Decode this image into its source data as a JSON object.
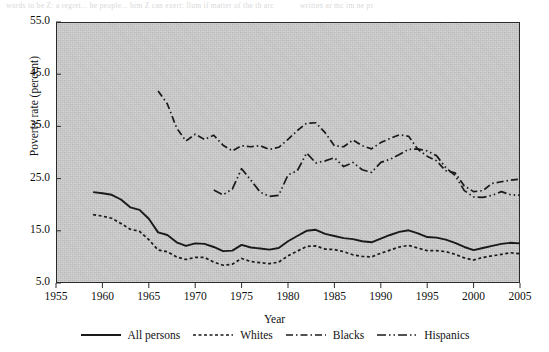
{
  "figure": {
    "ghost_text_top_left": "words to be Z: a regret... be people... him Z can exert: llum  if  matter of  the  th  arc",
    "ghost_text_top_right": "written   ar  mc  im  ne  pr"
  },
  "axes": {
    "y_label": "Poverty rate (percent)",
    "x_label": "Year",
    "y_ticks": [
      "5.0",
      "15.0",
      "25.0",
      "35.0",
      "45.0",
      "55.0"
    ],
    "y_tick_values": [
      5,
      15,
      25,
      35,
      45,
      55
    ],
    "x_ticks": [
      "1955",
      "1960",
      "1965",
      "1970",
      "1975",
      "1980",
      "1985",
      "1990",
      "1995",
      "2000",
      "2005"
    ],
    "x_tick_values": [
      1955,
      1960,
      1965,
      1970,
      1975,
      1980,
      1985,
      1990,
      1995,
      2000,
      2005
    ]
  },
  "legend": {
    "items": [
      {
        "label": "All persons",
        "style": "solid",
        "dash": "none",
        "icon": "solid-line-icon"
      },
      {
        "label": "Whites",
        "style": "dotted",
        "dash": "3,2.5",
        "icon": "dotted-line-icon"
      },
      {
        "label": "Blacks",
        "style": "dash-dot",
        "dash": "7,3,1.5,3",
        "icon": "dash-dot-line-icon"
      },
      {
        "label": "Hispanics",
        "style": "dash-dot-dot",
        "dash": "9,3,1.5,3,1.5,3",
        "icon": "dash-dot-dot-line-icon"
      }
    ]
  },
  "colors": {
    "plot_background": "#c9c9c9",
    "line": "#1a1a1a",
    "axis": "#2a2a2a",
    "text": "#111111"
  },
  "chart_data": {
    "type": "line",
    "title": "",
    "xlabel": "Year",
    "ylabel": "Poverty rate (percent)",
    "xlim": [
      1955,
      2005
    ],
    "ylim": [
      5.0,
      55.0
    ],
    "grid": false,
    "legend_position": "below",
    "series": [
      {
        "name": "All persons",
        "style": "solid",
        "x": [
          1959,
          1960,
          1961,
          1962,
          1963,
          1964,
          1965,
          1966,
          1967,
          1968,
          1969,
          1970,
          1971,
          1972,
          1973,
          1974,
          1975,
          1976,
          1977,
          1978,
          1979,
          1980,
          1981,
          1982,
          1983,
          1984,
          1985,
          1986,
          1987,
          1988,
          1989,
          1990,
          1991,
          1992,
          1993,
          1994,
          1995,
          1996,
          1997,
          1998,
          1999,
          2000,
          2001,
          2002,
          2003,
          2004,
          2005
        ],
        "values": [
          22.4,
          22.2,
          21.9,
          21.0,
          19.5,
          19.0,
          17.3,
          14.7,
          14.2,
          12.8,
          12.1,
          12.6,
          12.5,
          11.9,
          11.1,
          11.2,
          12.3,
          11.8,
          11.6,
          11.4,
          11.7,
          13.0,
          14.0,
          15.0,
          15.2,
          14.4,
          14.0,
          13.6,
          13.4,
          13.0,
          12.8,
          13.5,
          14.2,
          14.8,
          15.1,
          14.5,
          13.8,
          13.7,
          13.3,
          12.7,
          11.9,
          11.3,
          11.7,
          12.1,
          12.5,
          12.7,
          12.6
        ],
        "ylim_note": "percent"
      },
      {
        "name": "Whites",
        "style": "dotted",
        "x": [
          1959,
          1960,
          1961,
          1962,
          1963,
          1964,
          1965,
          1966,
          1967,
          1968,
          1969,
          1970,
          1971,
          1972,
          1973,
          1974,
          1975,
          1976,
          1977,
          1978,
          1979,
          1980,
          1981,
          1982,
          1983,
          1984,
          1985,
          1986,
          1987,
          1988,
          1989,
          1990,
          1991,
          1992,
          1993,
          1994,
          1995,
          1996,
          1997,
          1998,
          1999,
          2000,
          2001,
          2002,
          2003,
          2004,
          2005
        ],
        "values": [
          18.1,
          17.8,
          17.4,
          16.4,
          15.3,
          14.9,
          13.3,
          11.3,
          11.0,
          10.0,
          9.5,
          9.9,
          9.9,
          9.0,
          8.4,
          8.6,
          9.7,
          9.1,
          8.9,
          8.7,
          9.0,
          10.2,
          11.1,
          12.0,
          12.1,
          11.5,
          11.4,
          11.0,
          10.4,
          10.1,
          10.0,
          10.7,
          11.3,
          11.9,
          12.2,
          11.7,
          11.2,
          11.2,
          11.0,
          10.5,
          9.8,
          9.4,
          9.9,
          10.2,
          10.5,
          10.8,
          10.6
        ]
      },
      {
        "name": "Blacks",
        "style": "dash-dot",
        "x": [
          1966,
          1967,
          1968,
          1969,
          1970,
          1971,
          1972,
          1973,
          1974,
          1975,
          1976,
          1977,
          1978,
          1979,
          1980,
          1981,
          1982,
          1983,
          1984,
          1985,
          1986,
          1987,
          1988,
          1989,
          1990,
          1991,
          1992,
          1993,
          1994,
          1995,
          1996,
          1997,
          1998,
          1999,
          2000,
          2001,
          2002,
          2003,
          2004,
          2005
        ],
        "values": [
          41.8,
          39.3,
          34.7,
          32.2,
          33.5,
          32.5,
          33.3,
          31.4,
          30.3,
          31.3,
          31.1,
          31.3,
          30.6,
          31.0,
          32.5,
          34.2,
          35.6,
          35.7,
          33.8,
          31.3,
          31.1,
          32.4,
          31.3,
          30.7,
          31.9,
          32.7,
          33.4,
          33.1,
          30.6,
          29.3,
          28.4,
          26.5,
          26.1,
          23.6,
          22.5,
          22.7,
          24.1,
          24.4,
          24.7,
          24.9
        ]
      },
      {
        "name": "Hispanics",
        "style": "dash-dot-dot",
        "x": [
          1972,
          1973,
          1974,
          1975,
          1976,
          1977,
          1978,
          1979,
          1980,
          1981,
          1982,
          1983,
          1984,
          1985,
          1986,
          1987,
          1988,
          1989,
          1990,
          1991,
          1992,
          1993,
          1994,
          1995,
          1996,
          1997,
          1998,
          1999,
          2000,
          2001,
          2002,
          2003,
          2004,
          2005
        ],
        "values": [
          22.8,
          21.9,
          23.0,
          26.9,
          24.7,
          22.4,
          21.6,
          21.8,
          25.7,
          26.5,
          29.9,
          28.0,
          28.4,
          29.0,
          27.3,
          28.1,
          26.7,
          26.2,
          28.1,
          28.7,
          29.6,
          30.6,
          30.7,
          30.3,
          29.4,
          27.1,
          25.6,
          22.7,
          21.5,
          21.4,
          21.8,
          22.5,
          21.9,
          21.8
        ]
      }
    ]
  }
}
